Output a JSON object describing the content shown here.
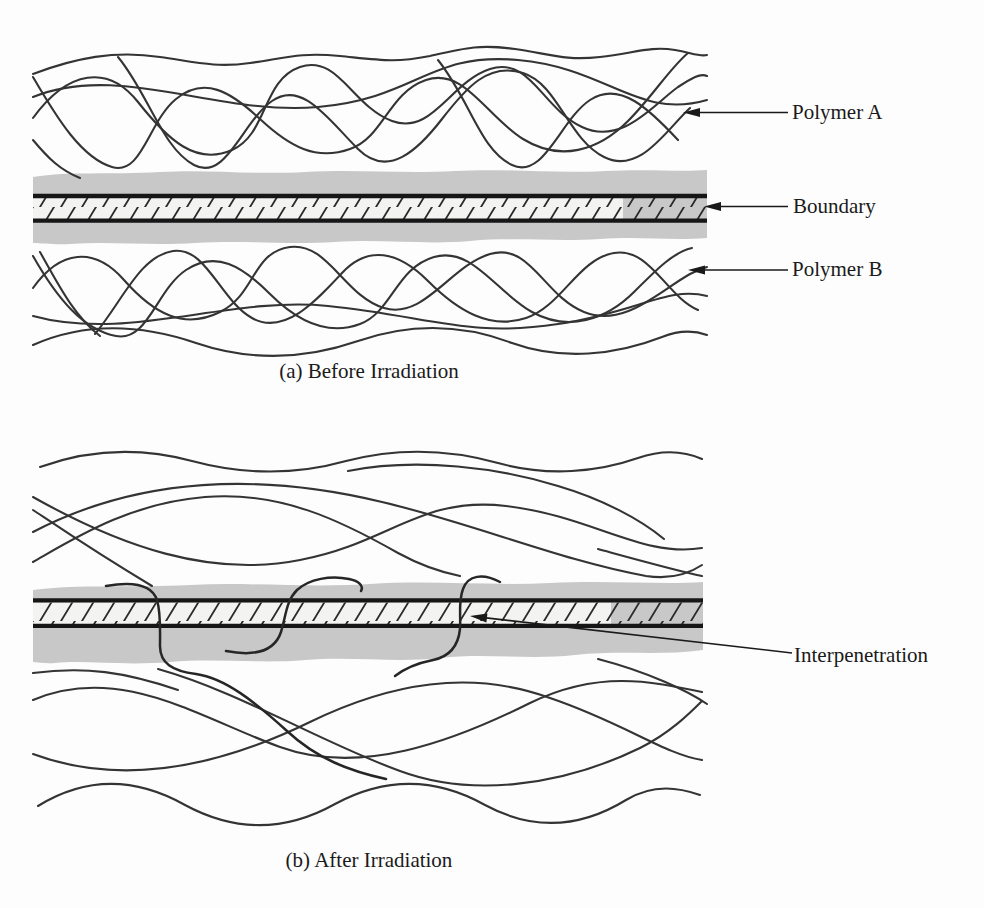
{
  "figure": {
    "panel_a": {
      "caption": "(a) Before Irradiation",
      "labels": {
        "polymer_a": "Polymer A",
        "boundary": "Boundary",
        "polymer_b": "Polymer B"
      }
    },
    "panel_b": {
      "caption": "(b) After Irradiation",
      "labels": {
        "interpenetration": "Interpenetration"
      }
    },
    "colors": {
      "background": "#fdfdfd",
      "band_gray": "#c8c8c8",
      "strip_fill": "#f3f3f1",
      "chain_stroke": "#343434",
      "boundary_line": "#161616",
      "text": "#1a1a1a"
    }
  }
}
